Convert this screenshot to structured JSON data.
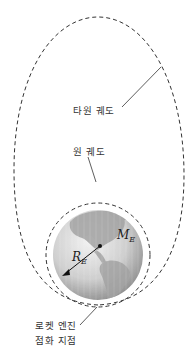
{
  "labels": {
    "elliptical_orbit": "타원 궤도",
    "circular_orbit": "원 궤도",
    "ignition_line1": "로켓 엔진",
    "ignition_line2": "점화 지점"
  },
  "symbols": {
    "mass_main": "M",
    "mass_sub": "E",
    "radius_main": "R",
    "radius_sub": "E"
  },
  "colors": {
    "orbit": "#333333",
    "earth_light": "#e4e4e4",
    "earth_dark": "#8a8a8a",
    "land": "#9a9a9a",
    "text": "#333333"
  }
}
